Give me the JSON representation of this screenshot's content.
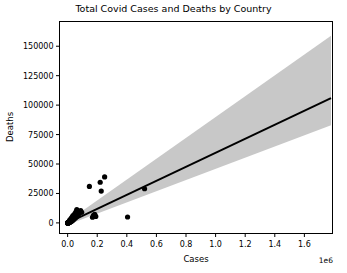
{
  "chart_data": {
    "type": "scatter",
    "title": "Total Covid Cases and Deaths by Country",
    "xlabel": "Cases",
    "ylabel": "Deaths",
    "x_offset_text": "1e6",
    "xlim": [
      -55000,
      1790000
    ],
    "ylim": [
      -9000,
      171000
    ],
    "grid": false,
    "legend": "none",
    "x_ticks": [
      0,
      200000,
      400000,
      600000,
      800000,
      1000000,
      1200000,
      1400000,
      1600000
    ],
    "x_tick_labels": [
      "0.0",
      "0.2",
      "0.4",
      "0.6",
      "0.8",
      "1.0",
      "1.2",
      "1.4",
      "1.6"
    ],
    "y_ticks": [
      0,
      25000,
      50000,
      75000,
      100000,
      125000,
      150000
    ],
    "y_tick_labels": [
      "0",
      "25000",
      "50000",
      "75000",
      "100000",
      "125000",
      "150000"
    ],
    "point_color": "#000000",
    "line_color": "#000000",
    "band_color": "#c8c8c8",
    "regression_line": {
      "x": [
        0,
        1780000
      ],
      "y": [
        0,
        106000
      ],
      "slope": 0.0595,
      "intercept": 0
    },
    "confidence_band": {
      "x": [
        0,
        1780000
      ],
      "upper": [
        1500,
        159000
      ],
      "lower": [
        -1500,
        83000
      ]
    },
    "points": [
      {
        "x": 147000,
        "y": 31000
      },
      {
        "x": 220000,
        "y": 34500
      },
      {
        "x": 250000,
        "y": 39000
      },
      {
        "x": 227000,
        "y": 27000
      },
      {
        "x": 520000,
        "y": 29000
      },
      {
        "x": 405000,
        "y": 5000
      },
      {
        "x": 175000,
        "y": 6500
      },
      {
        "x": 183000,
        "y": 7200
      },
      {
        "x": 190000,
        "y": 5500
      },
      {
        "x": 168000,
        "y": 4800
      },
      {
        "x": 95000,
        "y": 9000
      },
      {
        "x": 88000,
        "y": 10500
      },
      {
        "x": 80000,
        "y": 9500
      },
      {
        "x": 75000,
        "y": 7800
      },
      {
        "x": 70000,
        "y": 6200
      },
      {
        "x": 66000,
        "y": 8800
      },
      {
        "x": 60000,
        "y": 5200
      },
      {
        "x": 55000,
        "y": 6800
      },
      {
        "x": 52000,
        "y": 4200
      },
      {
        "x": 48000,
        "y": 5800
      },
      {
        "x": 45000,
        "y": 3600
      },
      {
        "x": 42000,
        "y": 4900
      },
      {
        "x": 40000,
        "y": 2800
      },
      {
        "x": 38000,
        "y": 4100
      },
      {
        "x": 35000,
        "y": 2200
      },
      {
        "x": 33000,
        "y": 3400
      },
      {
        "x": 30000,
        "y": 1800
      },
      {
        "x": 28000,
        "y": 2900
      },
      {
        "x": 26000,
        "y": 1400
      },
      {
        "x": 24000,
        "y": 2400
      },
      {
        "x": 22000,
        "y": 1100
      },
      {
        "x": 20000,
        "y": 1900
      },
      {
        "x": 18000,
        "y": 800
      },
      {
        "x": 17000,
        "y": 1600
      },
      {
        "x": 15000,
        "y": 600
      },
      {
        "x": 14000,
        "y": 1200
      },
      {
        "x": 12000,
        "y": 450
      },
      {
        "x": 11000,
        "y": 950
      },
      {
        "x": 10000,
        "y": 300
      },
      {
        "x": 9000,
        "y": 700
      },
      {
        "x": 8000,
        "y": 200
      },
      {
        "x": 7000,
        "y": 520
      },
      {
        "x": 6000,
        "y": 150
      },
      {
        "x": 5500,
        "y": 380
      },
      {
        "x": 5000,
        "y": 100
      },
      {
        "x": 4500,
        "y": 260
      },
      {
        "x": 4000,
        "y": 70
      },
      {
        "x": 3500,
        "y": 180
      },
      {
        "x": 3000,
        "y": 50
      },
      {
        "x": 2600,
        "y": 120
      },
      {
        "x": 2200,
        "y": 30
      },
      {
        "x": 1900,
        "y": 80
      },
      {
        "x": 1600,
        "y": 20
      },
      {
        "x": 1300,
        "y": 55
      },
      {
        "x": 1000,
        "y": 15
      },
      {
        "x": 800,
        "y": 35
      },
      {
        "x": 600,
        "y": 10
      },
      {
        "x": 400,
        "y": 20
      },
      {
        "x": 250,
        "y": 5
      },
      {
        "x": 100,
        "y": 2
      },
      {
        "x": 62000,
        "y": 11200
      },
      {
        "x": 58000,
        "y": 9800
      },
      {
        "x": 50000,
        "y": 8200
      },
      {
        "x": 46000,
        "y": 7000
      },
      {
        "x": 36000,
        "y": 6100
      },
      {
        "x": 31000,
        "y": 5000
      },
      {
        "x": 27000,
        "y": 4300
      },
      {
        "x": 21000,
        "y": 3300
      },
      {
        "x": 16000,
        "y": 2600
      },
      {
        "x": 13000,
        "y": 2000
      }
    ]
  }
}
